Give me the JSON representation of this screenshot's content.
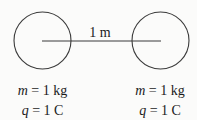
{
  "diagram": {
    "separation_label": "1 m",
    "left_sphere": {
      "mass_var": "m",
      "mass_eq": " = 1 kg",
      "charge_var": "q",
      "charge_eq": " = 1 C"
    },
    "right_sphere": {
      "mass_var": "m",
      "mass_eq": " = 1 kg",
      "charge_var": "q",
      "charge_eq": " = 1 C"
    },
    "colors": {
      "stroke": "#3a3a3a",
      "text": "#1a1a1a",
      "background": "#fbfbfa"
    }
  }
}
